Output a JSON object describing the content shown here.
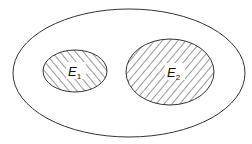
{
  "diagram": {
    "type": "venn",
    "colors": {
      "stroke": "#333333",
      "hatch": "#333333",
      "background": "#ffffff"
    },
    "sample_space": {
      "label": ""
    },
    "events": [
      {
        "id": "E1",
        "letter": "E",
        "subscript": "1",
        "hatch": "forward-diagonal"
      },
      {
        "id": "E2",
        "letter": "E",
        "subscript": "2",
        "hatch": "backward-diagonal"
      }
    ]
  }
}
